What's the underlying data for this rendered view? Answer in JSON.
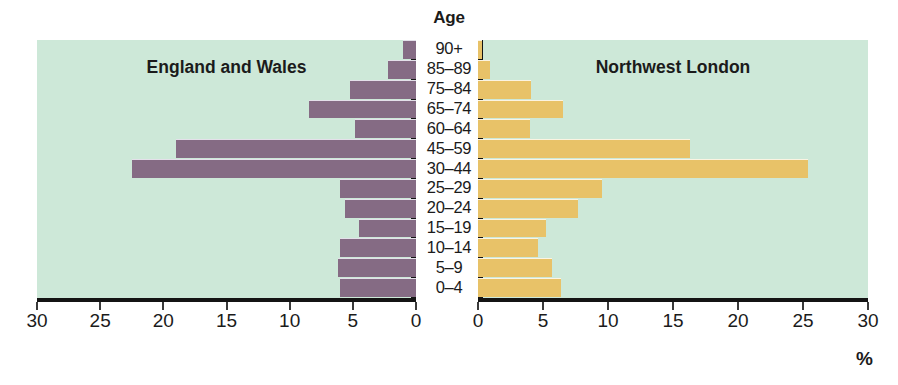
{
  "chart_data": {
    "type": "bar",
    "title": "",
    "subtitle": "",
    "orientation": "horizontal",
    "layout": "population-pyramid",
    "age_axis_title": "Age",
    "xlabel": "%",
    "ylabel": "Age",
    "grid": false,
    "legend": "none",
    "categories": [
      "90+",
      "85–89",
      "75–84",
      "65–74",
      "60–64",
      "45–59",
      "30–44",
      "25–29",
      "20–24",
      "15–19",
      "10–14",
      "5–9",
      "0–4"
    ],
    "panels": [
      {
        "name": "left",
        "title": "England and Wales",
        "color": "#856b84",
        "direction": "left",
        "xlim": [
          0,
          30
        ],
        "xticks": [
          30,
          25,
          20,
          15,
          10,
          5,
          0
        ],
        "values": [
          1.0,
          2.2,
          5.2,
          8.5,
          4.8,
          19.0,
          22.5,
          6.0,
          5.6,
          4.5,
          6.0,
          6.2,
          6.0
        ]
      },
      {
        "name": "right",
        "title": "Northwest London",
        "color": "#e8c268",
        "direction": "right",
        "xlim": [
          0,
          30
        ],
        "xticks": [
          0,
          5,
          10,
          15,
          20,
          25,
          30
        ],
        "values": [
          0.3,
          0.9,
          4.1,
          6.5,
          4.0,
          16.3,
          25.4,
          9.5,
          7.7,
          5.2,
          4.6,
          5.7,
          6.4
        ]
      }
    ]
  },
  "colors": {
    "plot_background": "#cde8d8",
    "axis": "#141414",
    "left_series": "#856b84",
    "right_series": "#e8c268",
    "text": "#1b1b1b"
  }
}
